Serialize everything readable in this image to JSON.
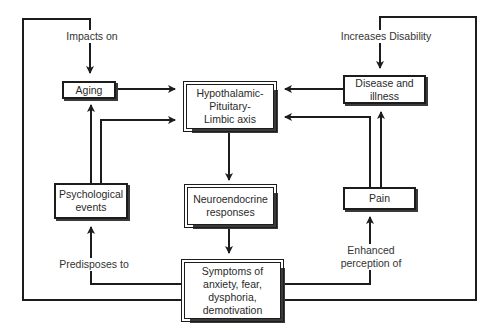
{
  "diagram": {
    "nodes": {
      "aging": "Aging",
      "hpl_axis": "Hypothalamic-\nPituitary-\nLimbic axis",
      "disease": "Disease and\nillness",
      "psychological": "Psychological\nevents",
      "neuroendocrine": "Neuroendocrine\nresponses",
      "pain": "Pain",
      "symptoms": "Symptoms of\nanxiety, fear,\ndysphoria,\ndemotivation"
    },
    "edge_labels": {
      "impacts_on": "Impacts on",
      "increases_disability": "Increases Disability",
      "predisposes_to": "Predisposes to",
      "enhanced_perception": "Enhanced\nperception of"
    },
    "edges": [
      {
        "from": "aging",
        "to": "hpl_axis"
      },
      {
        "from": "psychological",
        "to": "aging"
      },
      {
        "from": "psychological",
        "to": "hpl_axis"
      },
      {
        "from": "disease",
        "to": "hpl_axis"
      },
      {
        "from": "pain",
        "to": "disease"
      },
      {
        "from": "pain",
        "to": "hpl_axis"
      },
      {
        "from": "hpl_axis",
        "to": "neuroendocrine"
      },
      {
        "from": "neuroendocrine",
        "to": "symptoms"
      },
      {
        "from": "symptoms",
        "to": "psychological",
        "label": "Predisposes to"
      },
      {
        "from": "symptoms",
        "to": "pain",
        "label": "Enhanced perception of"
      },
      {
        "from": "symptoms",
        "to": "aging",
        "label": "Impacts on"
      },
      {
        "from": "symptoms",
        "to": "disease",
        "label": "Increases Disability"
      }
    ]
  }
}
